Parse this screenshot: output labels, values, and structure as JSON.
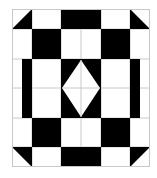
{
  "diagram": {
    "type": "geometric-quilt-pattern",
    "width": 157,
    "height": 178,
    "background": "#ffffff",
    "fill_color": "#000000",
    "line_color": "#c8c8c8",
    "border": {
      "x": 12,
      "y": 9,
      "w": 138,
      "h": 158
    },
    "grid_lines": {
      "vertical": [
        {
          "x": 32,
          "y1": 9,
          "y2": 167
        },
        {
          "x": 61,
          "y1": 9,
          "y2": 167
        },
        {
          "x": 81,
          "y1": 29,
          "y2": 147
        },
        {
          "x": 101,
          "y1": 9,
          "y2": 167
        },
        {
          "x": 130,
          "y1": 9,
          "y2": 167
        }
      ],
      "horizontal": [
        {
          "y": 29,
          "x1": 12,
          "x2": 150
        },
        {
          "y": 59,
          "x1": 12,
          "x2": 150
        },
        {
          "y": 88,
          "x1": 12,
          "x2": 150
        },
        {
          "y": 118,
          "x1": 12,
          "x2": 150
        },
        {
          "y": 147,
          "x1": 12,
          "x2": 150
        }
      ]
    },
    "rects": [
      {
        "name": "top-center-block",
        "x": 61,
        "y": 9,
        "w": 40,
        "h": 20
      },
      {
        "name": "upper-left-square",
        "x": 32,
        "y": 29,
        "w": 29,
        "h": 30
      },
      {
        "name": "upper-right-square",
        "x": 101,
        "y": 29,
        "w": 29,
        "h": 30
      },
      {
        "name": "left-bar",
        "x": 22,
        "y": 59,
        "w": 10,
        "h": 59
      },
      {
        "name": "right-bar",
        "x": 130,
        "y": 59,
        "w": 10,
        "h": 59
      },
      {
        "name": "center-block",
        "x": 61,
        "y": 59,
        "w": 40,
        "h": 59
      },
      {
        "name": "lower-left-square",
        "x": 32,
        "y": 118,
        "w": 29,
        "h": 29
      },
      {
        "name": "lower-right-square",
        "x": 101,
        "y": 118,
        "w": 29,
        "h": 29
      },
      {
        "name": "bottom-center-block",
        "x": 61,
        "y": 147,
        "w": 40,
        "h": 20
      }
    ],
    "triangles": [
      {
        "name": "top-left-triangle",
        "points": "12,29 32,9 32,29"
      },
      {
        "name": "top-right-triangle",
        "points": "130,9 150,29 130,29"
      },
      {
        "name": "bottom-left-triangle",
        "points": "12,147 32,147 32,167"
      },
      {
        "name": "bottom-right-triangle",
        "points": "130,147 150,147 130,167"
      }
    ],
    "diamond": {
      "name": "center-diamond",
      "points": "81,60 100,88 81,117 62,88",
      "fill": "#ffffff"
    }
  }
}
